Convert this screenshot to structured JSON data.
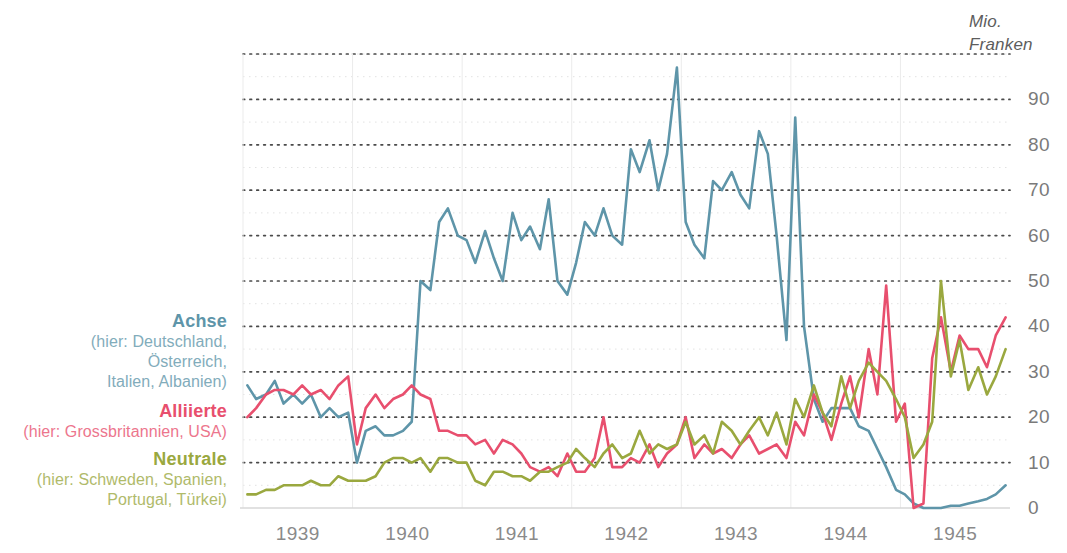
{
  "chart_data": {
    "type": "line",
    "title": "",
    "xlabel": "",
    "ylabel": "Mio. Franken",
    "ylim": [
      0,
      100
    ],
    "xlim": [
      1938.5,
      1945.5
    ],
    "grid": true,
    "y_ticks": [
      0,
      10,
      20,
      30,
      40,
      50,
      60,
      70,
      80,
      90
    ],
    "y_tick_labels": [
      "0",
      "10",
      "20",
      "30",
      "40",
      "50",
      "60",
      "70",
      "80",
      "90"
    ],
    "y_minor_ticks": [
      5,
      15,
      25,
      35,
      45,
      55,
      65,
      75,
      85,
      95,
      100
    ],
    "x_ticks": [
      1939,
      1940,
      1941,
      1942,
      1943,
      1944,
      1945
    ],
    "x_tick_labels": [
      "1939",
      "1940",
      "1941",
      "1942",
      "1943",
      "1944",
      "1945"
    ],
    "legend_position": "left-inside",
    "series": [
      {
        "name": "Achse",
        "detail": [
          "(hier: Deutschland,",
          "Österreich,",
          "Italien, Albanien)"
        ],
        "color": "#5e95a9",
        "x": [
          1938.54,
          1938.62,
          1938.71,
          1938.79,
          1938.87,
          1938.96,
          1939.04,
          1939.12,
          1939.21,
          1939.29,
          1939.37,
          1939.46,
          1939.54,
          1939.62,
          1939.71,
          1939.79,
          1939.87,
          1939.96,
          1940.04,
          1940.12,
          1940.21,
          1940.29,
          1940.37,
          1940.46,
          1940.54,
          1940.62,
          1940.71,
          1940.79,
          1940.87,
          1940.96,
          1941.04,
          1941.12,
          1941.21,
          1941.29,
          1941.37,
          1941.46,
          1941.54,
          1941.62,
          1941.71,
          1941.79,
          1941.87,
          1941.96,
          1942.04,
          1942.12,
          1942.21,
          1942.29,
          1942.37,
          1942.46,
          1942.54,
          1942.62,
          1942.71,
          1942.79,
          1942.87,
          1942.96,
          1943.04,
          1943.12,
          1943.21,
          1943.29,
          1943.37,
          1943.46,
          1943.54,
          1943.62,
          1943.71,
          1943.79,
          1943.87,
          1943.96,
          1944.04,
          1944.12,
          1944.21,
          1944.29,
          1944.37,
          1944.46,
          1944.54,
          1944.62,
          1944.71,
          1944.79,
          1944.87,
          1944.96,
          1945.04,
          1945.12,
          1945.21,
          1945.29,
          1945.37,
          1945.46
        ],
        "values": [
          27,
          24,
          25,
          28,
          23,
          25,
          23,
          25,
          20,
          22,
          20,
          21,
          10,
          17,
          18,
          16,
          16,
          17,
          19,
          50,
          48,
          63,
          66,
          60,
          59,
          54,
          61,
          55,
          50,
          65,
          59,
          62,
          57,
          68,
          50,
          47,
          54,
          63,
          60,
          66,
          60,
          58,
          79,
          74,
          81,
          70,
          78,
          97,
          63,
          58,
          55,
          72,
          70,
          74,
          69,
          66,
          83,
          78,
          60,
          37,
          86,
          40,
          24,
          19,
          22,
          22,
          22,
          18,
          17,
          13,
          9,
          4,
          3,
          1,
          0,
          0,
          0,
          0.5,
          0.5,
          1,
          1.5,
          2,
          3,
          5
        ]
      },
      {
        "name": "Alliierte",
        "detail": [
          "(hier: Grossbritannien, USA)"
        ],
        "color": "#e84f6e",
        "x": [
          1938.54,
          1938.62,
          1938.71,
          1938.79,
          1938.87,
          1938.96,
          1939.04,
          1939.12,
          1939.21,
          1939.29,
          1939.37,
          1939.46,
          1939.54,
          1939.62,
          1939.71,
          1939.79,
          1939.87,
          1939.96,
          1940.04,
          1940.12,
          1940.21,
          1940.29,
          1940.37,
          1940.46,
          1940.54,
          1940.62,
          1940.71,
          1940.79,
          1940.87,
          1940.96,
          1941.04,
          1941.12,
          1941.21,
          1941.29,
          1941.37,
          1941.46,
          1941.54,
          1941.62,
          1941.71,
          1941.79,
          1941.87,
          1941.96,
          1942.04,
          1942.12,
          1942.21,
          1942.29,
          1942.37,
          1942.46,
          1942.54,
          1942.62,
          1942.71,
          1942.79,
          1942.87,
          1942.96,
          1943.04,
          1943.12,
          1943.21,
          1943.29,
          1943.37,
          1943.46,
          1943.54,
          1943.62,
          1943.71,
          1943.79,
          1943.87,
          1943.96,
          1944.04,
          1944.12,
          1944.21,
          1944.29,
          1944.37,
          1944.46,
          1944.54,
          1944.62,
          1944.71,
          1944.79,
          1944.87,
          1944.96,
          1945.04,
          1945.12,
          1945.21,
          1945.29,
          1945.37,
          1945.46
        ],
        "values": [
          20,
          22,
          25,
          26,
          26,
          25,
          27,
          25,
          26,
          24,
          27,
          29,
          14,
          22,
          25,
          22,
          24,
          25,
          27,
          25,
          24,
          17,
          17,
          16,
          16,
          14,
          15,
          12,
          15,
          14,
          12,
          9,
          8,
          9,
          7,
          12,
          8,
          8,
          11,
          20,
          9,
          9,
          11,
          10,
          14,
          9,
          12,
          14,
          20,
          11,
          14,
          12,
          13,
          11,
          14,
          16,
          12,
          13,
          14,
          11,
          19,
          16,
          25,
          21,
          15,
          23,
          29,
          20,
          35,
          25,
          49,
          19,
          23,
          0,
          1,
          33,
          42,
          30,
          38,
          35,
          35,
          31,
          38,
          42
        ]
      },
      {
        "name": "Neutrale",
        "detail": [
          "(hier: Schweden, Spanien,",
          "Portugal, Türkei)"
        ],
        "color": "#9aa83f",
        "x": [
          1938.54,
          1938.62,
          1938.71,
          1938.79,
          1938.87,
          1938.96,
          1939.04,
          1939.12,
          1939.21,
          1939.29,
          1939.37,
          1939.46,
          1939.54,
          1939.62,
          1939.71,
          1939.79,
          1939.87,
          1939.96,
          1940.04,
          1940.12,
          1940.21,
          1940.29,
          1940.37,
          1940.46,
          1940.54,
          1940.62,
          1940.71,
          1940.79,
          1940.87,
          1940.96,
          1941.04,
          1941.12,
          1941.21,
          1941.29,
          1941.37,
          1941.46,
          1941.54,
          1941.62,
          1941.71,
          1941.79,
          1941.87,
          1941.96,
          1942.04,
          1942.12,
          1942.21,
          1942.29,
          1942.37,
          1942.46,
          1942.54,
          1942.62,
          1942.71,
          1942.79,
          1942.87,
          1942.96,
          1943.04,
          1943.12,
          1943.21,
          1943.29,
          1943.37,
          1943.46,
          1943.54,
          1943.62,
          1943.71,
          1943.79,
          1943.87,
          1943.96,
          1944.04,
          1944.12,
          1944.21,
          1944.29,
          1944.37,
          1944.46,
          1944.54,
          1944.62,
          1944.71,
          1944.79,
          1944.87,
          1944.96,
          1945.04,
          1945.12,
          1945.21,
          1945.29,
          1945.37,
          1945.46
        ],
        "values": [
          3,
          3,
          4,
          4,
          5,
          5,
          5,
          6,
          5,
          5,
          7,
          6,
          6,
          6,
          7,
          10,
          11,
          11,
          10,
          11,
          8,
          11,
          11,
          10,
          10,
          6,
          5,
          8,
          8,
          7,
          7,
          6,
          8,
          8,
          9,
          10,
          13,
          11,
          9,
          12,
          14,
          11,
          12,
          17,
          12,
          14,
          13,
          14,
          19,
          14,
          16,
          12,
          19,
          17,
          14,
          17,
          20,
          16,
          21,
          14,
          24,
          20,
          27,
          21,
          18,
          29,
          22,
          28,
          32,
          30,
          28,
          24,
          20,
          11,
          14,
          19,
          50,
          29,
          37,
          26,
          31,
          25,
          29,
          35
        ]
      }
    ]
  },
  "axis": {
    "unit_line1": "Mio.",
    "unit_line2": "Franken"
  }
}
